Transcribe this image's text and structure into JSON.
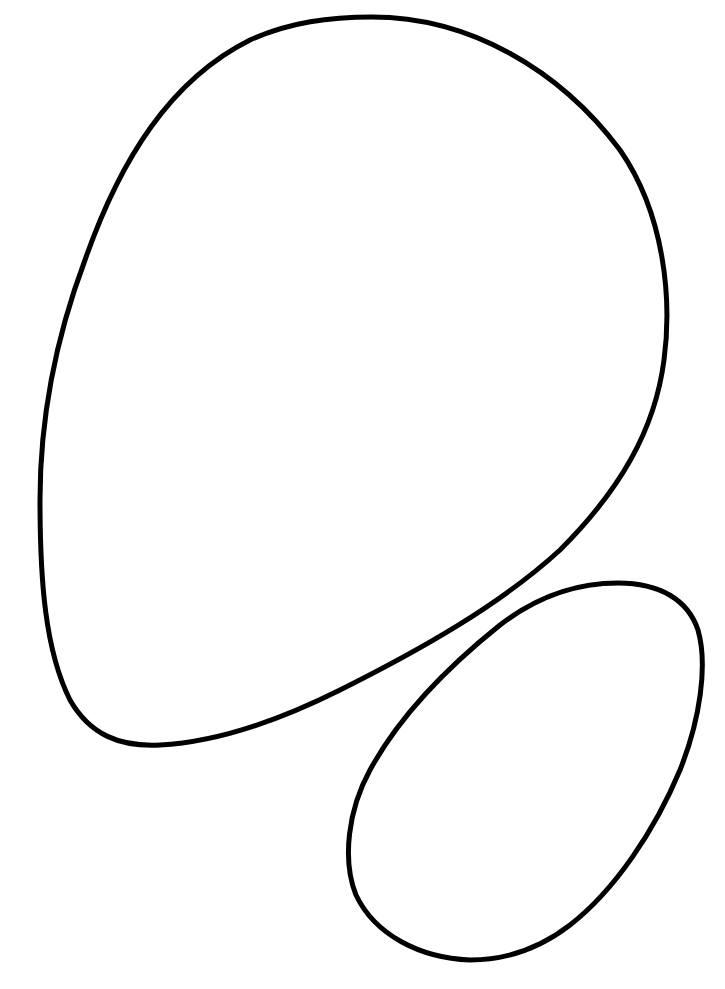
{
  "canvas": {
    "width": 725,
    "height": 989,
    "background": "#ffffff"
  },
  "shapes": [
    {
      "name": "large-blob-outline",
      "stroke": "#000000",
      "stroke_width": 5,
      "path": "M 372 17 C 470 17 560 70 620 150 C 665 215 672 300 664 360 C 655 430 620 490 560 550 C 500 605 420 650 340 690 C 280 720 220 742 160 745 C 120 747 90 735 70 700 C 45 650 40 580 40 500 C 40 420 55 340 85 260 C 120 160 170 80 250 40 C 290 22 330 17 372 17 Z"
    },
    {
      "name": "small-oval-outline",
      "stroke": "#000000",
      "stroke_width": 5,
      "path": "M 618 583 C 660 583 688 600 698 630 C 708 665 700 720 680 770 C 655 830 615 890 570 925 C 535 952 500 960 470 960 C 420 958 375 935 356 895 C 342 860 348 810 370 770 C 400 715 450 665 500 625 C 535 598 575 583 618 583 Z"
    }
  ]
}
